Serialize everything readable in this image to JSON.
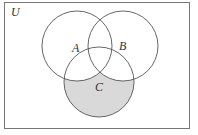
{
  "diagram": {
    "type": "venn",
    "universe_label": "U",
    "sets": [
      {
        "id": "A",
        "label": "A"
      },
      {
        "id": "B",
        "label": "B"
      },
      {
        "id": "C",
        "label": "C"
      }
    ],
    "shaded_region": "C − (A ∪ B)",
    "colors": {
      "stroke": "#555555",
      "shade": "#d9d9d9",
      "background": "#ffffff"
    }
  }
}
